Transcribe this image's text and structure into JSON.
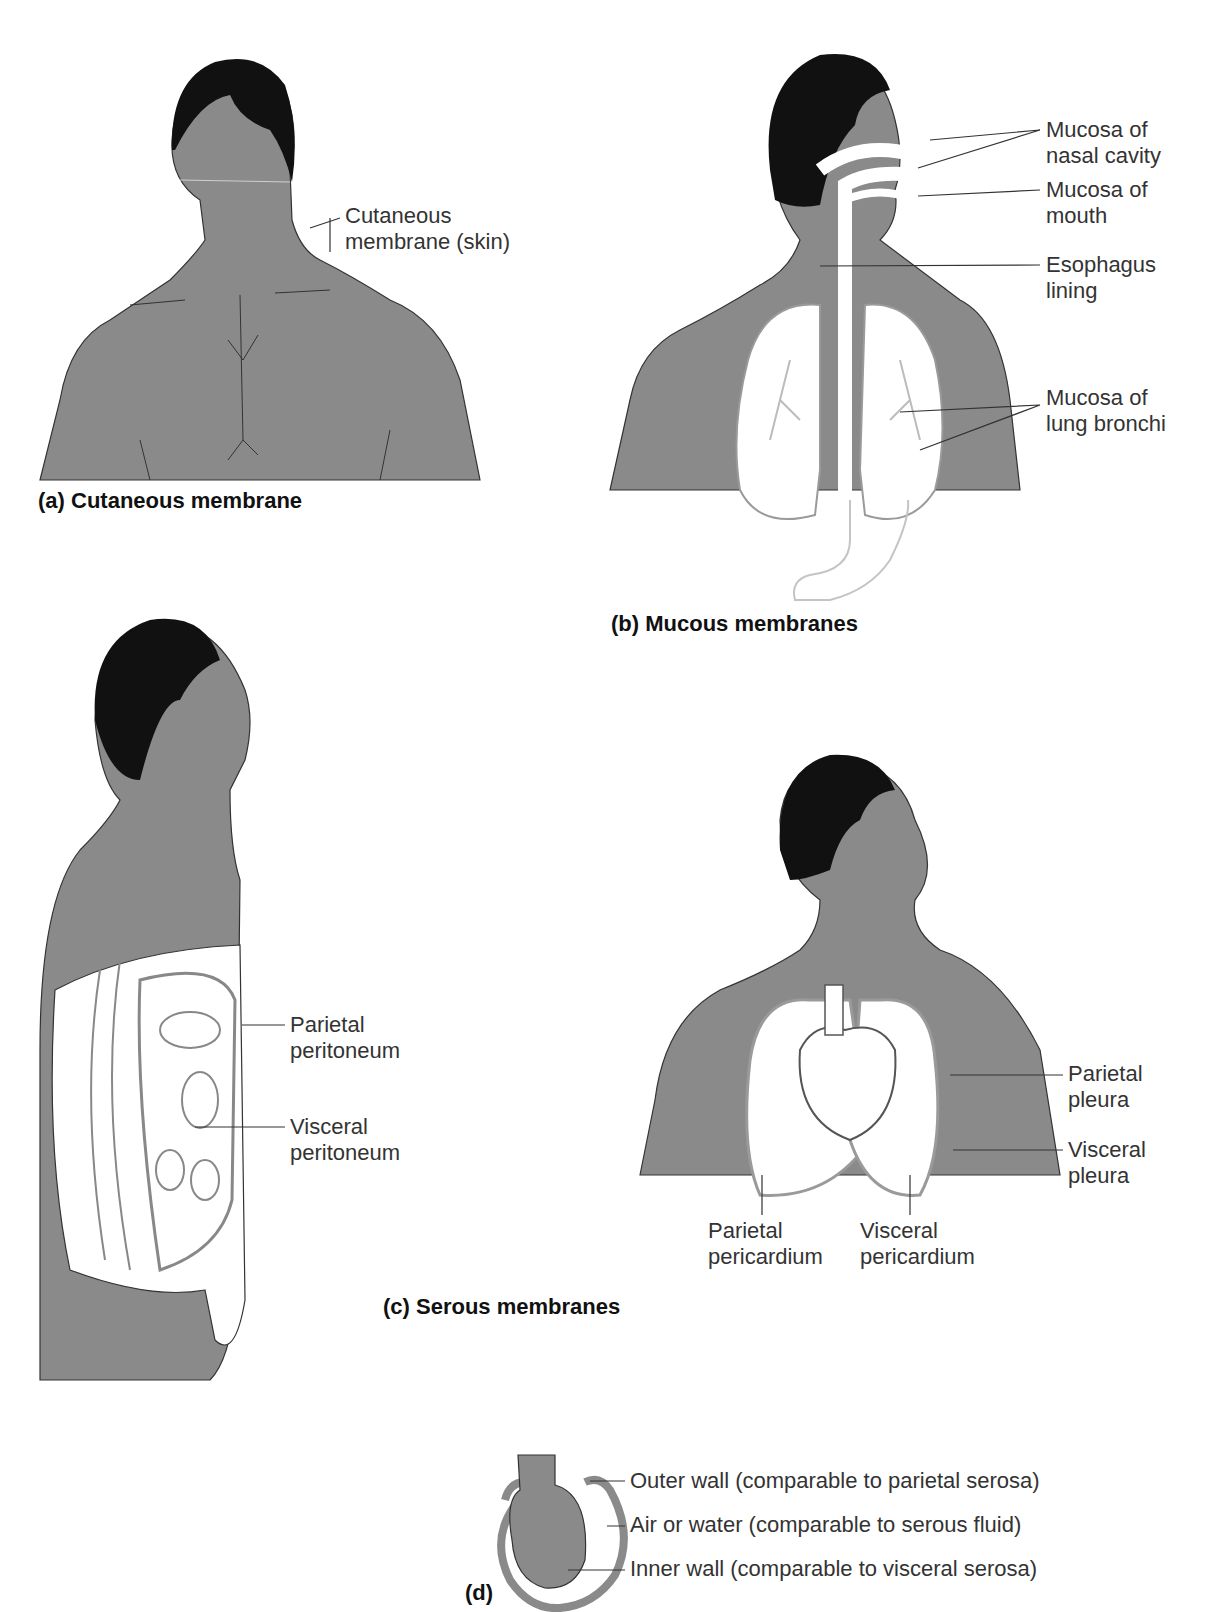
{
  "panels": {
    "a": {
      "caption": "(a) Cutaneous membrane",
      "labels": [
        "Cutaneous\nmembrane (skin)"
      ]
    },
    "b": {
      "caption": "(b) Mucous membranes",
      "labels": [
        "Mucosa of\nnasal cavity",
        "Mucosa of\nmouth",
        "Esophagus\nlining",
        "Mucosa of\nlung bronchi"
      ]
    },
    "c": {
      "caption": "(c) Serous membranes",
      "labels_abdomen": [
        "Parietal\nperitoneum",
        "Visceral\nperitoneum"
      ],
      "labels_thorax": [
        "Parietal\npleura",
        "Visceral\npleura",
        "Parietal\npericardium",
        "Visceral\npericardium"
      ]
    },
    "d": {
      "caption": "(d)",
      "labels": [
        "Outer wall (comparable to parietal serosa)",
        "Air or water (comparable to serous fluid)",
        "Inner wall (comparable to visceral serosa)"
      ]
    }
  },
  "colors": {
    "skin": "#8a8a8a",
    "hair": "#111111",
    "membrane": "#ffffff",
    "line": "#333333",
    "organ_outline": "#9a9a9a"
  }
}
